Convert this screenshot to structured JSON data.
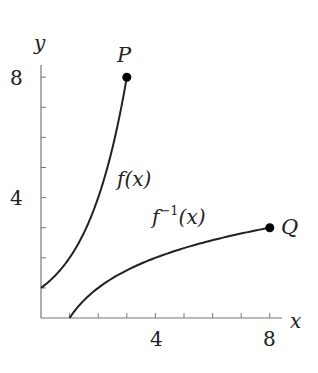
{
  "chart_data": {
    "type": "line",
    "title": "",
    "xlabel": "x",
    "ylabel": "y",
    "xlim": [
      0,
      8.4
    ],
    "ylim": [
      0,
      8.4
    ],
    "x_tick_labels": [
      "4",
      "8"
    ],
    "y_tick_labels": [
      "4",
      "8"
    ],
    "x_minor_ticks": [
      1,
      2,
      3,
      4,
      5,
      6,
      7,
      8
    ],
    "y_minor_ticks": [
      1,
      2,
      3,
      4,
      5,
      6,
      7,
      8
    ],
    "grid": false,
    "series": [
      {
        "name": "f(x)",
        "label": "f(x)",
        "points": [
          [
            0,
            1
          ],
          [
            0.5,
            1.41
          ],
          [
            1,
            2
          ],
          [
            1.5,
            2.83
          ],
          [
            2,
            4
          ],
          [
            2.5,
            5.66
          ],
          [
            3,
            8
          ]
        ],
        "endpoint": {
          "name": "P",
          "x": 3,
          "y": 8
        }
      },
      {
        "name": "f^-1(x)",
        "label": "f⁻¹(x)",
        "points": [
          [
            1,
            0
          ],
          [
            1.41,
            0.5
          ],
          [
            2,
            1
          ],
          [
            2.83,
            1.5
          ],
          [
            4,
            2
          ],
          [
            5.66,
            2.5
          ],
          [
            8,
            3
          ]
        ],
        "endpoint": {
          "name": "Q",
          "x": 8,
          "y": 3
        }
      }
    ],
    "annotations": [
      "P",
      "Q",
      "f(x)",
      "f⁻¹(x)"
    ]
  },
  "labels": {
    "x_axis": "x",
    "y_axis": "y",
    "x_tick_4": "4",
    "x_tick_8": "8",
    "y_tick_4": "4",
    "y_tick_8": "8",
    "point_p": "P",
    "point_q": "Q",
    "f_label": "f(x)",
    "finv_f": "f",
    "finv_sup": "−1",
    "finv_arg": "(x)"
  },
  "colors": {
    "axis": "#777777",
    "curve": "#222222",
    "point": "#000000"
  }
}
